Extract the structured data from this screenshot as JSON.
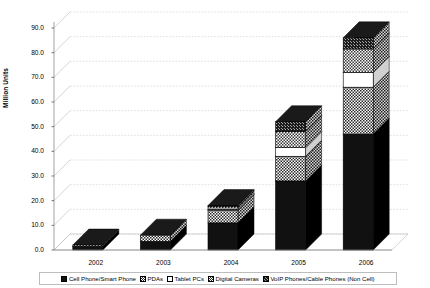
{
  "chart_data": {
    "type": "bar",
    "stacked": true,
    "title": "",
    "xlabel": "",
    "ylabel": "Million Units",
    "categories": [
      "2002",
      "2003",
      "2004",
      "2005",
      "2006"
    ],
    "ylim": [
      0.0,
      90.0
    ],
    "ytick_labels": [
      "0.0",
      "10.0",
      "20.0",
      "30.0",
      "40.0",
      "50.0",
      "60.0",
      "70.0",
      "80.0",
      "90.0"
    ],
    "ytick_values": [
      0,
      10,
      20,
      30,
      40,
      50,
      60,
      70,
      80,
      90
    ],
    "grid": true,
    "legend_position": "bottom",
    "series": [
      {
        "name": "Cell Phone/Smart Phone",
        "pattern": "solid-black",
        "color": "#111111",
        "values": [
          1.5,
          3.5,
          11.0,
          28.0,
          47.0
        ]
      },
      {
        "name": "PDAs",
        "pattern": "dense-checker",
        "color": "#888888",
        "values": [
          0.5,
          2.5,
          5.0,
          10.0,
          19.0
        ]
      },
      {
        "name": "Tablet PCs",
        "pattern": "white",
        "color": "#ffffff",
        "values": [
          0.0,
          0.0,
          0.5,
          3.5,
          6.0
        ]
      },
      {
        "name": "Digital Cameras",
        "pattern": "checker",
        "color": "#999999",
        "values": [
          0.0,
          0.0,
          1.0,
          6.5,
          9.5
        ]
      },
      {
        "name": "VoIP Phones/Cable Phones (Non Cell)",
        "pattern": "dark-noise",
        "color": "#3a3a3a",
        "values": [
          0.0,
          0.0,
          0.5,
          4.0,
          4.5
        ]
      }
    ],
    "totals": [
      2.0,
      6.0,
      18.0,
      52.0,
      86.0
    ]
  },
  "legend": {
    "items": [
      {
        "label": "Cell Phone/Smart Phone"
      },
      {
        "label": "PDAs"
      },
      {
        "label": "Tablet PCs"
      },
      {
        "label": "Digital Cameras"
      },
      {
        "label": "VoIP Phones/Cable Phones (Non Cell)"
      }
    ]
  }
}
